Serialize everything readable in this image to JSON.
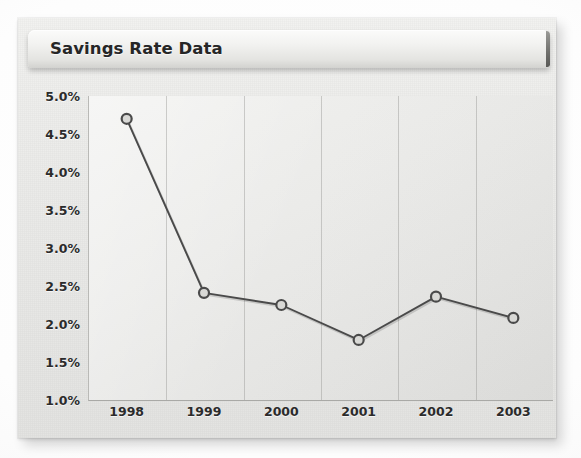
{
  "chart_data": {
    "type": "line",
    "title": "Savings Rate Data",
    "xlabel": "",
    "ylabel": "",
    "categories": [
      "1998",
      "1999",
      "2000",
      "2001",
      "2002",
      "2003"
    ],
    "values": [
      4.7,
      2.41,
      2.25,
      1.79,
      2.36,
      2.08
    ],
    "series": [
      {
        "name": "Savings Rate",
        "values": [
          4.7,
          2.41,
          2.25,
          1.79,
          2.36,
          2.08
        ]
      }
    ],
    "ylim": [
      1.0,
      5.0
    ],
    "ytick_values": [
      5.0,
      4.5,
      4.0,
      3.5,
      3.0,
      2.5,
      2.0,
      1.5,
      1.0
    ],
    "ytick_labels": [
      "5.0%",
      "4.5%",
      "4.0%",
      "3.5%",
      "3.0%",
      "2.5%",
      "2.0%",
      "1.5%",
      "1.0%"
    ],
    "xtick_labels": [
      "1998",
      "1999",
      "2000",
      "2001",
      "2002",
      "2003"
    ],
    "grid": "vertical-only",
    "legend": "none",
    "marker": "circle-open",
    "line_color": "#4a4a4a",
    "marker_fill": "#d9d9d6",
    "marker_stroke": "#4a4a4a",
    "plot_background": "#e9e9e7"
  },
  "card": {
    "title": "Savings Rate Data",
    "background": "#eeeeec"
  }
}
